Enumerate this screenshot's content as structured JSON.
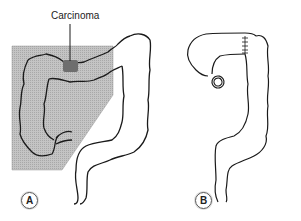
{
  "figure": {
    "panels": [
      {
        "label": "A",
        "annotation": "Carcinoma"
      },
      {
        "label": "B"
      }
    ]
  },
  "colors": {
    "shade": "#bdbdbd",
    "ink": "#1a1a1a",
    "tumor": "#6e6e6e"
  }
}
